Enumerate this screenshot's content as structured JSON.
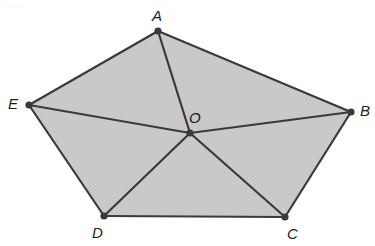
{
  "figure": {
    "kind": "geometry-diagram",
    "canvas": {
      "width": 375,
      "height": 246
    },
    "colors": {
      "background": "#ffffff",
      "polygon_fill": "#c9c9c9",
      "stroke": "#3a3a3a",
      "vertex_dot": "#3a3a3a",
      "label_text": "#1c1c1c"
    },
    "stroke_width": 2.2,
    "vertex_radius": 3.6
  },
  "vertices": [
    {
      "id": "A",
      "label": "A",
      "x": 158,
      "y": 31,
      "label_x": 152,
      "label_y": 8,
      "type": "polygon-vertex"
    },
    {
      "id": "B",
      "label": "B",
      "x": 351,
      "y": 112,
      "label_x": 360,
      "label_y": 103,
      "type": "polygon-vertex"
    },
    {
      "id": "C",
      "label": "C",
      "x": 285,
      "y": 217,
      "label_x": 287,
      "label_y": 226,
      "type": "polygon-vertex"
    },
    {
      "id": "D",
      "label": "D",
      "x": 104,
      "y": 216,
      "label_x": 92,
      "label_y": 225,
      "type": "polygon-vertex"
    },
    {
      "id": "E",
      "label": "E",
      "x": 29,
      "y": 105,
      "label_x": 8,
      "label_y": 96,
      "type": "polygon-vertex"
    },
    {
      "id": "O",
      "label": "O",
      "x": 190,
      "y": 133,
      "label_x": 189,
      "label_y": 110,
      "type": "interior-point"
    }
  ],
  "polygon": {
    "name": "pentagon-ABCDE",
    "points": "158,31 351,112 285,217 104,216 29,105",
    "vertex_order": [
      "A",
      "B",
      "C",
      "D",
      "E"
    ]
  },
  "edges": [
    {
      "id": "AB",
      "from": "A",
      "to": "B",
      "x1": 158,
      "y1": 31,
      "x2": 351,
      "y2": 112,
      "kind": "polygon-side"
    },
    {
      "id": "BC",
      "from": "B",
      "to": "C",
      "x1": 351,
      "y1": 112,
      "x2": 285,
      "y2": 217,
      "kind": "polygon-side"
    },
    {
      "id": "CD",
      "from": "C",
      "to": "D",
      "x1": 285,
      "y1": 217,
      "x2": 104,
      "y2": 216,
      "kind": "polygon-side"
    },
    {
      "id": "DE",
      "from": "D",
      "to": "E",
      "x1": 104,
      "y1": 216,
      "x2": 29,
      "y2": 105,
      "kind": "polygon-side"
    },
    {
      "id": "EA",
      "from": "E",
      "to": "A",
      "x1": 29,
      "y1": 105,
      "x2": 158,
      "y2": 31,
      "kind": "polygon-side"
    }
  ],
  "radii": [
    {
      "id": "OA",
      "from": "O",
      "to": "A",
      "x1": 190,
      "y1": 133,
      "x2": 158,
      "y2": 31,
      "kind": "center-spoke"
    },
    {
      "id": "OB",
      "from": "O",
      "to": "B",
      "x1": 190,
      "y1": 133,
      "x2": 351,
      "y2": 112,
      "kind": "center-spoke"
    },
    {
      "id": "OC",
      "from": "O",
      "to": "C",
      "x1": 190,
      "y1": 133,
      "x2": 285,
      "y2": 217,
      "kind": "center-spoke"
    },
    {
      "id": "OD",
      "from": "O",
      "to": "D",
      "x1": 190,
      "y1": 133,
      "x2": 104,
      "y2": 216,
      "kind": "center-spoke"
    },
    {
      "id": "OE",
      "from": "O",
      "to": "E",
      "x1": 190,
      "y1": 133,
      "x2": 29,
      "y2": 105,
      "kind": "center-spoke"
    }
  ]
}
